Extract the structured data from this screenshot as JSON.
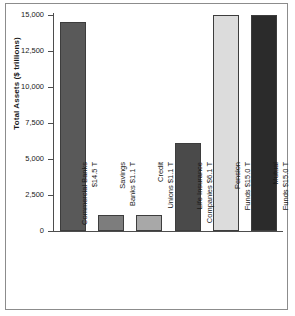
{
  "chart_data": {
    "type": "bar",
    "title": "",
    "xlabel": "",
    "ylabel": "Total Assets ($ trillions)",
    "ylim": [
      0,
      15000
    ],
    "yticks": [
      0,
      2500,
      5000,
      7500,
      10000,
      12500,
      15000
    ],
    "ytick_labels": [
      "0",
      "2,500",
      "5,000",
      "7,500",
      "10,000",
      "12,500",
      "15,000"
    ],
    "grid": false,
    "legend": "none",
    "categories": [
      "Commercial Banks $14.5 T",
      "Savings Banks $1.1 T",
      "Credit Unions $1.1 T",
      "Life Insurance Companies $6.1 T",
      "Pension Funds $15.0 T",
      "Mutual Funds $15.0 T"
    ],
    "values": [
      14500,
      1100,
      1100,
      6100,
      15000,
      15000
    ],
    "bar_colors": [
      "#595959",
      "#7d7d7d",
      "#a8a8a8",
      "#4a4a4a",
      "#dcdcdc",
      "#2b2b2b"
    ],
    "bars": [
      {
        "category": "Commercial Banks",
        "value_label": "$14.5 T",
        "line1": "Commercial Banks",
        "line2": "$14.5 T",
        "value": 14500,
        "color": "#595959"
      },
      {
        "category": "Savings Banks",
        "value_label": "$1.1 T",
        "line1": "Savings",
        "line2": "Banks $1.1 T",
        "value": 1100,
        "color": "#7d7d7d"
      },
      {
        "category": "Credit Unions",
        "value_label": "$1.1 T",
        "line1": "Credit",
        "line2": "Unions $1.1 T",
        "value": 1100,
        "color": "#a8a8a8"
      },
      {
        "category": "Life Insurance Companies",
        "value_label": "$6.1 T",
        "line1": "Life Insurance",
        "line2": "Companies $6.1 T",
        "value": 6100,
        "color": "#4a4a4a"
      },
      {
        "category": "Pension Funds",
        "value_label": "$15.0 T",
        "line1": "Pension",
        "line2": "Funds $15.0 T",
        "value": 15000,
        "color": "#dcdcdc"
      },
      {
        "category": "Mutual Funds",
        "value_label": "$15.0 T",
        "line1": "Mutual",
        "line2": "Funds $15.0 T",
        "value": 15000,
        "color": "#2b2b2b"
      }
    ]
  },
  "axis": {
    "y_title": "Total Assets ($ trillions)"
  },
  "colors": {
    "axis": "#4d4d4d",
    "text": "#1a1a1a",
    "border": "#8c8c8c",
    "background": "#ffffff"
  }
}
